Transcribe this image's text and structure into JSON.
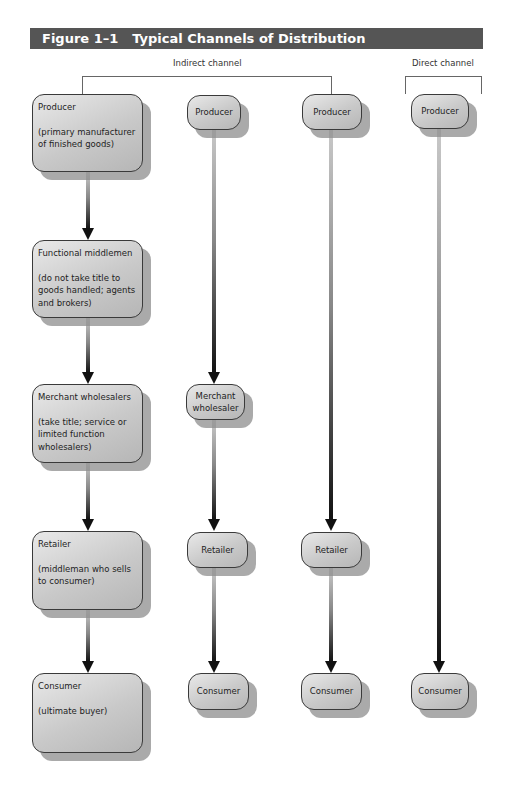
{
  "figure": {
    "number": "Figure 1–1",
    "title": "Typical Channels of Distribution",
    "header_color": "#555555"
  },
  "groups": {
    "indirect": "Indirect channel",
    "direct": "Direct channel"
  },
  "columns": [
    {
      "id": "col1",
      "group": "indirect",
      "nodes": [
        {
          "title": "Producer",
          "note": "(primary manufacturer of finished goods)"
        },
        {
          "title": "Functional middlemen",
          "note": "(do not take title to goods handled; agents and brokers)"
        },
        {
          "title": "Merchant wholesalers",
          "note": "(take title; service or limited function wholesalers)"
        },
        {
          "title": "Retailer",
          "note": "(middleman who sells to consumer)"
        },
        {
          "title": "Consumer",
          "note": "(ultimate buyer)"
        }
      ]
    },
    {
      "id": "col2",
      "group": "indirect",
      "nodes": [
        {
          "title": "Producer"
        },
        {
          "title": "Merchant wholesaler"
        },
        {
          "title": "Retailer"
        },
        {
          "title": "Consumer"
        }
      ]
    },
    {
      "id": "col3",
      "group": "indirect",
      "nodes": [
        {
          "title": "Producer"
        },
        {
          "title": "Retailer"
        },
        {
          "title": "Consumer"
        }
      ]
    },
    {
      "id": "col4",
      "group": "direct",
      "nodes": [
        {
          "title": "Producer"
        },
        {
          "title": "Consumer"
        }
      ]
    }
  ]
}
